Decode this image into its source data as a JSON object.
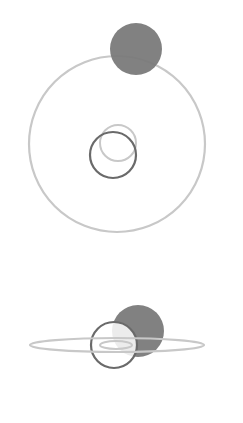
{
  "diagram": {
    "colors": {
      "background": "#ffffff",
      "filled_body": "#7a7a7a",
      "dark_outline": "#6a6a6a",
      "light_outline": "#c8c8c8"
    },
    "top_view": {
      "orbit": {
        "cx": 117,
        "cy": 144,
        "r": 88
      },
      "filled_body": {
        "cx": 136,
        "cy": 49,
        "r": 26
      },
      "central_body_dark": {
        "cx": 113,
        "cy": 155,
        "r": 23
      },
      "central_body_light": {
        "cx": 118,
        "cy": 143,
        "r": 18
      }
    },
    "side_view": {
      "orbit_ellipse": {
        "cx": 117,
        "cy": 345,
        "rx": 87,
        "ry": 7
      },
      "filled_body": {
        "cx": 138,
        "cy": 331,
        "r": 26
      },
      "central_body": {
        "cx": 114,
        "cy": 345,
        "r": 23
      },
      "inner_ellipse": {
        "cx": 116,
        "cy": 345,
        "rx": 16,
        "ry": 4
      }
    }
  }
}
